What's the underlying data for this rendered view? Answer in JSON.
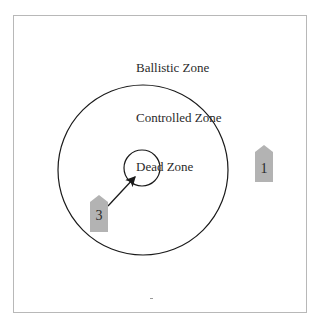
{
  "diagram": {
    "zones": {
      "ballistic": "Ballistic Zone",
      "controlled": "Controlled Zone",
      "dead": "Dead Zone"
    },
    "units": [
      {
        "id": "unit-1",
        "label": "1"
      },
      {
        "id": "unit-3",
        "label": "3"
      }
    ],
    "colors": {
      "unit_fill": "#b3b3b3",
      "circle_stroke": "#1a1a1a",
      "frame": "#b8b8b8"
    }
  }
}
